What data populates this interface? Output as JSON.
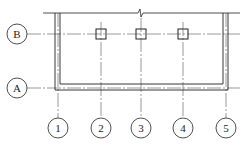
{
  "diagram": {
    "type": "structural grid plan",
    "row_axes": [
      {
        "label": "B",
        "y": 34
      },
      {
        "label": "A",
        "y": 88
      }
    ],
    "column_axes": [
      {
        "label": "1",
        "x": 58
      },
      {
        "label": "2",
        "x": 101
      },
      {
        "label": "3",
        "x": 141
      },
      {
        "label": "4",
        "x": 183
      },
      {
        "label": "5",
        "x": 226
      }
    ],
    "columns_on_axis_B": [
      "2",
      "3",
      "4"
    ],
    "colors": {
      "line": "#222222",
      "axis": "#444444"
    }
  }
}
